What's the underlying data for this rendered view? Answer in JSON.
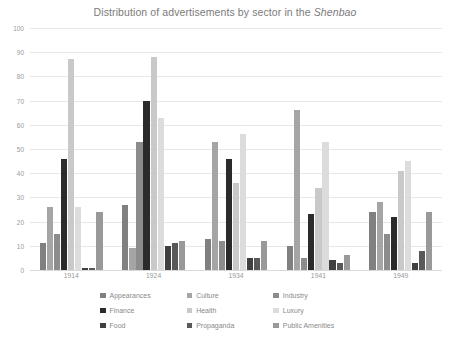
{
  "chart_data": {
    "type": "bar",
    "title": "Distribution of advertisements by sector in the Shenbao",
    "title_plain": "Distribution of advertisements by sector in the ",
    "title_italic": "Shenbao",
    "xlabel": "",
    "ylabel": "",
    "ylim": [
      0,
      100
    ],
    "ytick_step": 10,
    "yticks": [
      100,
      90,
      80,
      70,
      60,
      50,
      40,
      30,
      20,
      10,
      0
    ],
    "grid": true,
    "legend_position": "bottom",
    "categories": [
      "1914",
      "1924",
      "1934",
      "1941",
      "1949"
    ],
    "series": [
      {
        "name": "Appearances",
        "color": "#808080",
        "values": [
          11,
          27,
          13,
          10,
          24
        ]
      },
      {
        "name": "Culture",
        "color": "#a5a5a5",
        "values": [
          26,
          9,
          53,
          66,
          28
        ]
      },
      {
        "name": "Industry",
        "color": "#8c8c8c",
        "values": [
          15,
          53,
          12,
          5,
          15
        ]
      },
      {
        "name": "Finance",
        "color": "#2b2b2b",
        "values": [
          46,
          70,
          46,
          23,
          22
        ]
      },
      {
        "name": "Health",
        "color": "#c9c9c9",
        "values": [
          87,
          88,
          36,
          34,
          41
        ]
      },
      {
        "name": "Luxury",
        "color": "#dcdcdc",
        "values": [
          26,
          63,
          56,
          53,
          45
        ]
      },
      {
        "name": "Food",
        "color": "#404040",
        "values": [
          1,
          10,
          5,
          4,
          3
        ]
      },
      {
        "name": "Propaganda",
        "color": "#595959",
        "values": [
          1,
          11,
          5,
          3,
          8
        ]
      },
      {
        "name": "Public Amenities",
        "color": "#999999",
        "values": [
          24,
          12,
          12,
          6,
          24
        ]
      }
    ]
  }
}
